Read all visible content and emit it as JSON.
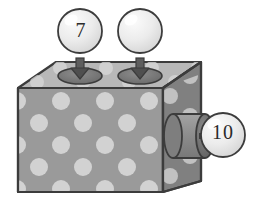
{
  "scene": {
    "title": "function-machine-box",
    "background_color": "#ffffff"
  },
  "machine": {
    "name": "polka-dot-box",
    "body_color": "#9a9a9a",
    "top_face_color": "#b8b8b8",
    "right_face_color": "#808080",
    "dot_color": "#d2d2d2",
    "outline_color": "#3a3a3a"
  },
  "inputs": [
    {
      "id": "input-1",
      "label": "7",
      "port_name": "top-port-left",
      "arrow_direction": "down",
      "bubble_fill": "#e8e8e8"
    },
    {
      "id": "input-2",
      "label": "",
      "port_name": "top-port-right",
      "arrow_direction": "down",
      "bubble_fill": "#e8e8e8"
    }
  ],
  "output": {
    "id": "output-1",
    "label": "10",
    "port_name": "side-spout",
    "arrow_direction": "right",
    "bubble_fill": "#e8e8e8",
    "spout_color": "#8c8c8c",
    "spout_cap_color": "#6f6f6f"
  }
}
